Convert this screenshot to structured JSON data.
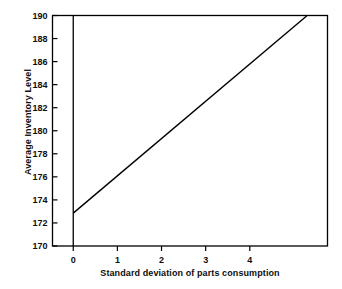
{
  "chart_data": {
    "type": "line",
    "title": "",
    "xlabel": "Standard deviation of parts consumption",
    "ylabel": "Average Inventory Level",
    "xlim": [
      -0.47,
      5.76
    ],
    "ylim": [
      170,
      190
    ],
    "xticks": [
      0,
      1,
      2,
      3,
      4
    ],
    "xtick_labels": [
      "0",
      "1",
      "2",
      "3",
      "4"
    ],
    "yticks": [
      170,
      172,
      174,
      176,
      178,
      180,
      182,
      184,
      186,
      188,
      190
    ],
    "ytick_labels": [
      "170",
      "172",
      "174",
      "176",
      "178",
      "180",
      "182",
      "184",
      "186",
      "188",
      "190"
    ],
    "grid": false,
    "legend": false,
    "series": [
      {
        "name": "Average inventory level",
        "x": [
          0,
          5.3
        ],
        "values": [
          172.85,
          190.0
        ]
      }
    ],
    "annotations": {
      "zero_axis_line": 0,
      "line_color": "#000000",
      "line_width": 1.4,
      "frame_color": "#000000"
    }
  },
  "colors": {
    "background": "#ffffff",
    "foreground": "#000000",
    "text": "#0d0d0d"
  }
}
